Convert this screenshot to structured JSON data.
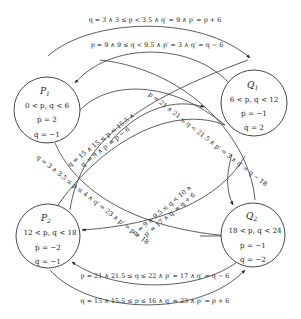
{
  "diagram": {
    "type": "hybrid-automaton",
    "colors": {
      "stroke": "#333333",
      "text": "#222222",
      "background": "#ffffff"
    },
    "states": [
      {
        "id": "P1",
        "name": "P",
        "sub": "1",
        "invariant": "0 < p, q < 6",
        "p_dot": "ṗ = 2",
        "q_dot": "q̇ = −1"
      },
      {
        "id": "Q1",
        "name": "Q",
        "sub": "1",
        "invariant": "6 < p, q < 12",
        "p_dot": "ṗ = −1",
        "q_dot": "q̇ = 2"
      },
      {
        "id": "P2",
        "name": "P",
        "sub": "2",
        "invariant": "12 < p, q < 18",
        "p_dot": "ṗ = −2",
        "q_dot": "q̇ = −1"
      },
      {
        "id": "Q2",
        "name": "Q",
        "sub": "2",
        "invariant": "18 < p, q < 24",
        "p_dot": "ṗ = −1",
        "q_dot": "q̇ = −2"
      }
    ],
    "transitions": [
      {
        "from": "P1",
        "to": "Q1",
        "label": "q = 3 ∧ 3 ≤ p < 3.5 ∧ q′ = 9 ∧ p′ = p + 6"
      },
      {
        "from": "Q1",
        "to": "P1",
        "label": "p = 9 ∧ 9 ≤ q < 9.5 ∧ p′ = 3 ∧ q′ = q − 6"
      },
      {
        "from": "P2",
        "to": "P1",
        "label_line1": "q = 15 ∧ 15 ≤ p < 15.5 ∧",
        "label_line2": "q′ = 9 ∧ p′ = p − 6"
      },
      {
        "from": "Q2",
        "to": "Q1",
        "label": "p = 21 ∧ 21 ≤ q < 21.5 ∧ p′ = 3 ∧ q′ = q − 18"
      },
      {
        "from": "P1",
        "to": "P2",
        "label": "q = 3 ∧ 3.5 ≤ p ≤ 4 ∧ q′ = 23 ∧ p′ = p + 18"
      },
      {
        "from": "Q1",
        "to": "Q2",
        "label_line1": "p = 9 ∧ 9.5 ≤ q < 10 ∧",
        "label_line2": "p′ = 17 ∧ q′ = q + 6"
      },
      {
        "from": "Q2",
        "to": "P2",
        "label": "p = 21 ∧ 21.5 ≤ q ≤ 22 ∧ p′ = 17 ∧ q′ = q − 6"
      },
      {
        "from": "P2",
        "to": "Q2",
        "label": "q = 15 ∧ 15.5 ≤ p ≤ 16 ∧ q′ = 23 ∧ p′ = p + 6"
      }
    ]
  }
}
